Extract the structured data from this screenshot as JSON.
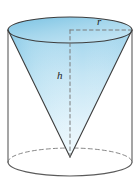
{
  "figure": {
    "name": "cone-inscribed-in-cylinder",
    "background_color": "#ffffff",
    "labels": {
      "radius": "r",
      "height": "h"
    },
    "colors": {
      "outline": "#5b5b5b",
      "cone_outline": "#3d3d3d",
      "dashed": "#7a7a7a",
      "fill_top": "#8ecbe8",
      "fill_mid": "#bde2f2",
      "fill_bottom": "#e8f6fc",
      "ellipse_top_fill": "#a6d6ec",
      "label_color": "#1b1b1b"
    },
    "geometry": {
      "cylinder": {
        "left_x": 8,
        "right_x": 132,
        "top_center_y": 30,
        "bottom_center_y": 162,
        "ellipse_rx": 62,
        "ellipse_top_ry": 13,
        "ellipse_bottom_ry": 14
      },
      "cone": {
        "apex_x": 70,
        "apex_y": 157,
        "rim_center_y": 30,
        "rim_rx": 62,
        "rim_ry": 13
      },
      "radius_line": {
        "from_x": 70,
        "from_y": 30,
        "to_x": 131,
        "to_y": 30
      },
      "height_line": {
        "from_x": 70,
        "from_y": 30,
        "to_x": 70,
        "to_y": 157
      }
    }
  }
}
